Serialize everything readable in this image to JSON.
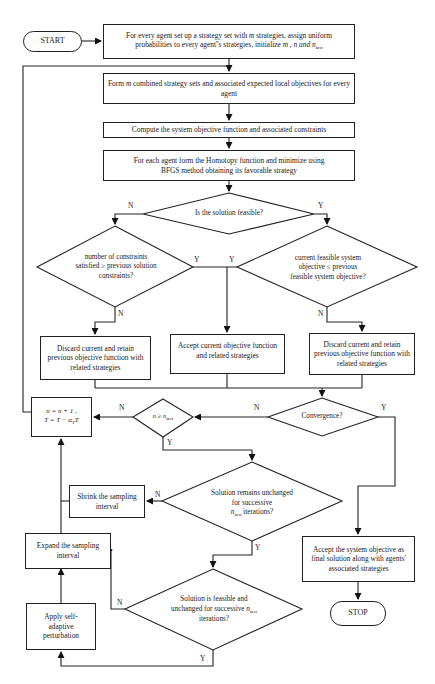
{
  "flowchart": {
    "start_label": "START",
    "stop_label": "STOP",
    "init_box": "For every agent set up a strategy set with m strategies, assign uniform probabilities to every agent''s strategies, initialize m , n and n_test",
    "init_box_line1": "For every agent set up a strategy set with",
    "init_box_m": "m",
    "init_box_line1b": "strategies, assign uniform",
    "init_box_line2": "probabilities to every agent''s strategies, initialize",
    "init_box_vars": "m , n and n",
    "init_box_sub": "test",
    "form_box_pre": "Form",
    "form_box_m": "m",
    "form_box_post": "combined strategy sets and associated expected local objectives for every agent",
    "compute_box": "Compute the system objective function and associated constraints",
    "homotopy_box": "For each agent form the Homotopy function and minimize using BFGS method obtaining its favorable strategy",
    "feasible_decision": "Is the solution feasible?",
    "constraints_decision": "number of constraints satisfied ≥ previous solution constraints?",
    "objective_decision": "current feasible system objective ≤ previous feasible system objective?",
    "discard_left_box": "Discard current and retain previous objective function with related strategies",
    "accept_current_box": "Accept current objective function and related strategies",
    "discard_right_box": "Discard current and retain previous objective function with related strategies",
    "convergence_decision": "Convergence?",
    "ntest_decision": "n ≥ n",
    "ntest_decision_sub": "test",
    "update_box_line1": "n = n + 1 ,",
    "update_box_line2": "T = T − α",
    "update_box_sub": "T",
    "update_box_tail": "T",
    "remains_decision_line": "Solution remains unchanged for successive",
    "remains_decision_var": "n",
    "remains_decision_sub": "test",
    "remains_decision_tail": "iterations?",
    "shrink_box": "Shrink the sampling interval",
    "expand_box": "Expand the sampling interval",
    "final_box": "Accept the system objective as final solution along with agents' associated strategies",
    "feasible_unchanged_line": "Solution is feasible and unchanged for successive",
    "feasible_unchanged_var": "n",
    "feasible_unchanged_sub": "test",
    "feasible_unchanged_tail": "iterations?",
    "perturb_box": "Apply self-adaptive perturbation"
  },
  "labels": {
    "yes": "Y",
    "no": "N"
  }
}
